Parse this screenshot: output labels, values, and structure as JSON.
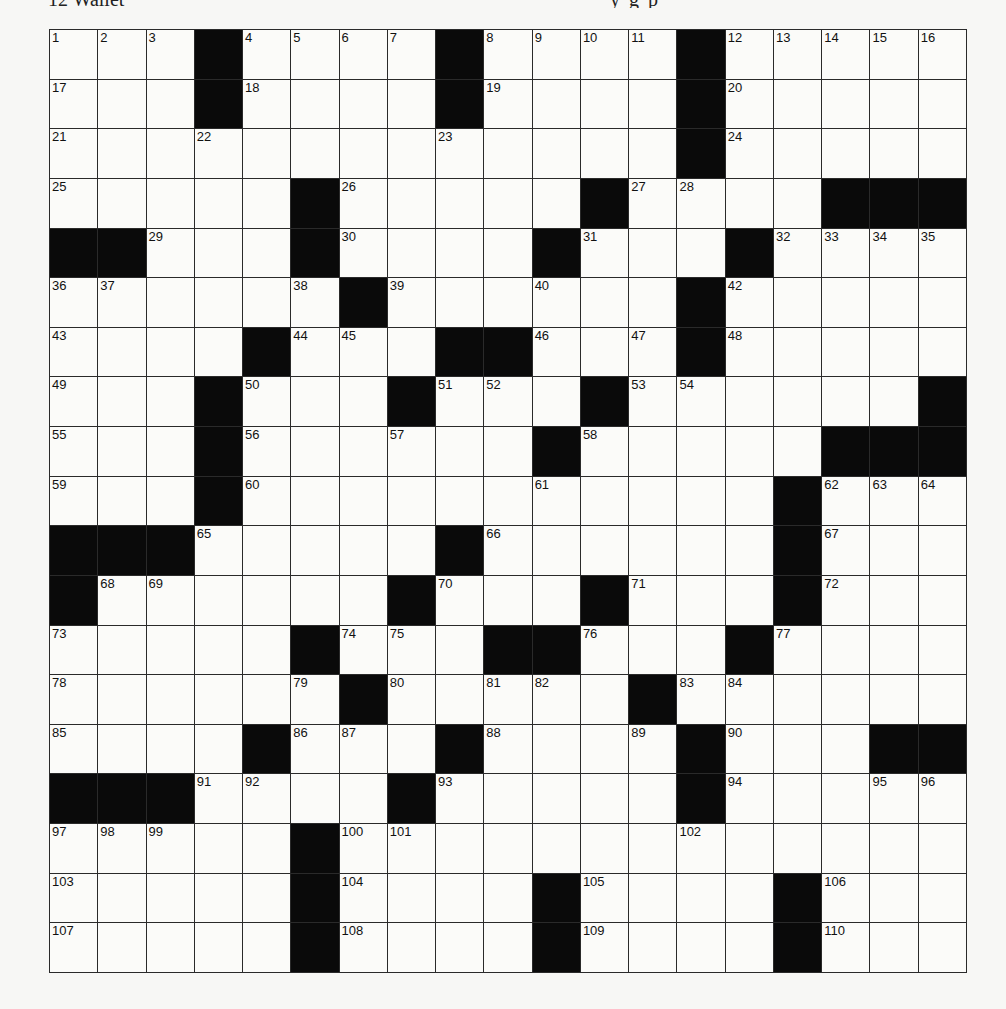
{
  "header": {
    "clipped_left": "12 Wallet",
    "clipped_right": "y          g p"
  },
  "puzzle": {
    "rows": 19,
    "cols": 19,
    "layout": [
      "...#....#....#.....",
      "...#....#....#.....",
      ".............#.....",
      ".....#.....#....###",
      "##...#....#...#....",
      "......#......#.....",
      "....#...##...#.....",
      "...#...#...#......#",
      "...#......#.....###",
      "...#...........#...",
      "###.....#......#...",
      "#......#...#...#...",
      ".....#...##...#....",
      "......#.....#......",
      "....#...#....#...##",
      "###....#.....#.....",
      ".....#.............",
      ".....#....#....#...",
      ".....#....#....#..."
    ],
    "numbers": [
      [
        1,
        2,
        3,
        null,
        4,
        5,
        6,
        7,
        null,
        8,
        9,
        10,
        11,
        null,
        12,
        13,
        14,
        15,
        16
      ],
      [
        17,
        null,
        null,
        null,
        18,
        null,
        null,
        null,
        null,
        19,
        null,
        null,
        null,
        null,
        20,
        null,
        null,
        null,
        null
      ],
      [
        21,
        null,
        null,
        22,
        null,
        null,
        null,
        null,
        23,
        null,
        null,
        null,
        null,
        null,
        24,
        null,
        null,
        null,
        null
      ],
      [
        25,
        null,
        null,
        null,
        null,
        null,
        26,
        null,
        null,
        null,
        null,
        null,
        27,
        28,
        null,
        null,
        null,
        null,
        null
      ],
      [
        null,
        null,
        29,
        null,
        null,
        null,
        30,
        null,
        null,
        null,
        null,
        31,
        null,
        null,
        null,
        32,
        33,
        34,
        35
      ],
      [
        36,
        37,
        null,
        null,
        null,
        38,
        null,
        39,
        null,
        null,
        40,
        null,
        null,
        41,
        42,
        null,
        null,
        null,
        null
      ],
      [
        43,
        null,
        null,
        null,
        null,
        44,
        45,
        null,
        null,
        null,
        46,
        null,
        47,
        null,
        48,
        null,
        null,
        null,
        null
      ],
      [
        49,
        null,
        null,
        null,
        50,
        null,
        null,
        null,
        51,
        52,
        null,
        null,
        53,
        54,
        null,
        null,
        null,
        null,
        null
      ],
      [
        55,
        null,
        null,
        null,
        56,
        null,
        null,
        57,
        null,
        null,
        null,
        58,
        null,
        null,
        null,
        null,
        null,
        null,
        null
      ],
      [
        59,
        null,
        null,
        null,
        60,
        null,
        null,
        null,
        null,
        null,
        61,
        null,
        null,
        null,
        null,
        null,
        62,
        63,
        64
      ],
      [
        null,
        null,
        null,
        65,
        null,
        null,
        null,
        null,
        null,
        66,
        null,
        null,
        null,
        null,
        null,
        null,
        67,
        null,
        null
      ],
      [
        null,
        68,
        69,
        null,
        null,
        null,
        null,
        null,
        70,
        null,
        null,
        null,
        71,
        null,
        null,
        null,
        72,
        null,
        null
      ],
      [
        73,
        null,
        null,
        null,
        null,
        null,
        74,
        75,
        null,
        null,
        null,
        76,
        null,
        null,
        null,
        77,
        null,
        null,
        null
      ],
      [
        78,
        null,
        null,
        null,
        null,
        79,
        null,
        80,
        null,
        81,
        82,
        null,
        null,
        83,
        84,
        null,
        null,
        null,
        null
      ],
      [
        85,
        null,
        null,
        null,
        null,
        86,
        87,
        null,
        null,
        88,
        null,
        null,
        89,
        null,
        90,
        null,
        null,
        null,
        null
      ],
      [
        null,
        null,
        null,
        91,
        92,
        null,
        null,
        null,
        93,
        null,
        null,
        null,
        null,
        null,
        94,
        null,
        null,
        95,
        96
      ],
      [
        97,
        98,
        99,
        null,
        null,
        null,
        100,
        101,
        null,
        null,
        null,
        null,
        null,
        102,
        null,
        null,
        null,
        null,
        null
      ],
      [
        103,
        null,
        null,
        null,
        null,
        null,
        104,
        null,
        null,
        null,
        null,
        105,
        null,
        null,
        null,
        null,
        106,
        null,
        null
      ],
      [
        107,
        null,
        null,
        null,
        null,
        null,
        108,
        null,
        null,
        null,
        null,
        109,
        null,
        null,
        null,
        null,
        110,
        null,
        null
      ]
    ]
  },
  "colors": {
    "block": "#0a0a0a",
    "cell": "#fbfbf9",
    "line": "#2a2a2a",
    "background": "#f7f7f5"
  }
}
